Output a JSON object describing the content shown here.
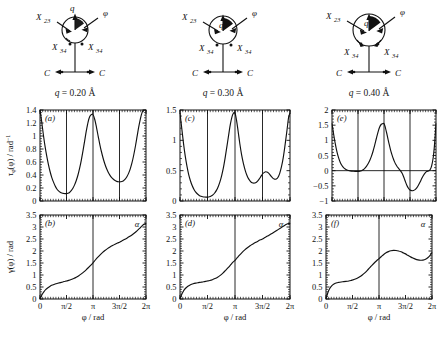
{
  "figure": {
    "columns": [
      {
        "q_label_prefix": "q",
        "q_label_eq": " = 0.20 ",
        "q_label_unit": "Å",
        "schematic": {
          "x23_label": "X",
          "x23_sub": "23",
          "x34_left_label": "X",
          "x34_left_sub": "34",
          "x34_right_label": "X",
          "x34_right_sub": "34",
          "q_arrow_label": "q",
          "phi_label": "φ",
          "c_left_label": "C",
          "c_right_label": "C"
        }
      },
      {
        "q_label_prefix": "q",
        "q_label_eq": " = 0.30 ",
        "q_label_unit": "Å",
        "schematic": {
          "x23_label": "X",
          "x23_sub": "23",
          "x34_left_label": "X",
          "x34_left_sub": "34",
          "x34_right_label": "X",
          "x34_right_sub": "34",
          "q_arrow_label": "q",
          "phi_label": "φ",
          "c_left_label": "C",
          "c_right_label": "C"
        }
      },
      {
        "q_label_prefix": "q",
        "q_label_eq": " = 0.40 ",
        "q_label_unit": "Å",
        "schematic": {
          "x23_label": "X",
          "x23_sub": "23",
          "x34_left_label": "X",
          "x34_left_sub": "34",
          "x34_right_label": "X",
          "x34_right_sub": "34",
          "q_arrow_label": "q",
          "phi_label": "φ",
          "c_left_label": "C",
          "c_right_label": "C"
        }
      }
    ],
    "xaxis": {
      "label_main": "φ",
      "label_unit": " / rad",
      "ticklabels": [
        "0",
        "π/2",
        "π",
        "3π/2",
        "2π"
      ],
      "tickvalues": [
        0,
        1.5707963,
        3.1415927,
        4.712389,
        6.2831853
      ]
    },
    "yaxis_tau": {
      "label_tau": "τ",
      "label_tau_sub": "φ",
      "label_arg": "(φ) / rad",
      "label_exp": "−1"
    },
    "yaxis_gamma": {
      "label": "γ(φ) / rad"
    },
    "alpha_annotation": "α",
    "vertical_guides": [
      1.5707963,
      3.1415927,
      4.712389
    ]
  },
  "chart_data": [
    {
      "id": "a",
      "panel_label": "(a)",
      "type": "line",
      "title": "q = 0.20 Å",
      "xlabel": "φ / rad",
      "ylabel": "τφ(φ) / rad⁻¹",
      "xlim": [
        0,
        6.2831853
      ],
      "ylim": [
        0,
        1.4
      ],
      "yticks": [
        0,
        0.2,
        0.4,
        0.6,
        0.8,
        1,
        1.2,
        1.4
      ],
      "yticklabels": [
        "0",
        "0.2",
        "0.4",
        "0.6",
        "0.8",
        "1",
        "1.2",
        "1.4"
      ],
      "grid": false,
      "vlines": [
        1.5707963,
        3.1415927,
        4.712389
      ],
      "x": [
        0.0,
        0.1,
        0.2,
        0.3,
        0.4,
        0.5,
        0.6,
        0.7,
        0.8,
        0.9,
        1.0,
        1.1,
        1.2,
        1.3,
        1.4,
        1.5,
        1.5708,
        1.65,
        1.75,
        1.85,
        1.95,
        2.05,
        2.15,
        2.25,
        2.35,
        2.45,
        2.55,
        2.65,
        2.75,
        2.85,
        2.95,
        3.05,
        3.1416,
        3.25,
        3.35,
        3.45,
        3.55,
        3.65,
        3.75,
        3.85,
        3.95,
        4.05,
        4.15,
        4.25,
        4.35,
        4.45,
        4.55,
        4.65,
        4.7124,
        4.85,
        4.95,
        5.05,
        5.15,
        5.25,
        5.35,
        5.45,
        5.55,
        5.65,
        5.75,
        5.85,
        5.95,
        6.05,
        6.15,
        6.2832
      ],
      "y": [
        1.4,
        1.22,
        1.02,
        0.84,
        0.69,
        0.56,
        0.45,
        0.36,
        0.29,
        0.23,
        0.185,
        0.155,
        0.135,
        0.122,
        0.116,
        0.113,
        0.113,
        0.118,
        0.132,
        0.158,
        0.196,
        0.248,
        0.315,
        0.4,
        0.505,
        0.63,
        0.775,
        0.93,
        1.085,
        1.215,
        1.3,
        1.33,
        1.33,
        1.25,
        1.13,
        0.995,
        0.865,
        0.75,
        0.65,
        0.565,
        0.495,
        0.44,
        0.395,
        0.36,
        0.335,
        0.315,
        0.302,
        0.296,
        0.295,
        0.3,
        0.312,
        0.335,
        0.372,
        0.425,
        0.495,
        0.585,
        0.7,
        0.835,
        0.985,
        1.135,
        1.265,
        1.36,
        1.4,
        1.4
      ]
    },
    {
      "id": "b",
      "panel_label": "(b)",
      "type": "line",
      "title": "",
      "xlabel": "φ / rad",
      "ylabel": "γ(φ) / rad",
      "xlim": [
        0,
        6.2831853
      ],
      "ylim": [
        0,
        3.5
      ],
      "yticks": [
        0,
        0.5,
        1,
        1.5,
        2,
        2.5,
        3,
        3.5
      ],
      "yticklabels": [
        "0",
        "0.5",
        "1",
        "1.5",
        "2",
        "2.5",
        "3",
        "3.5"
      ],
      "grid": false,
      "vlines": [
        3.1415927
      ],
      "annotation": "α",
      "x": [
        0.0,
        0.08,
        0.16,
        0.25,
        0.35,
        0.45,
        0.6,
        0.75,
        0.9,
        1.05,
        1.2,
        1.35,
        1.5,
        1.5708,
        1.7,
        1.85,
        2.0,
        2.15,
        2.3,
        2.45,
        2.6,
        2.75,
        2.9,
        3.0,
        3.1416,
        3.28,
        3.4,
        3.55,
        3.7,
        3.85,
        4.0,
        4.15,
        4.3,
        4.45,
        4.6,
        4.7124,
        4.85,
        5.0,
        5.15,
        5.3,
        5.45,
        5.6,
        5.75,
        5.9,
        6.05,
        6.18,
        6.2832
      ],
      "y": [
        0.0,
        0.13,
        0.23,
        0.32,
        0.4,
        0.46,
        0.535,
        0.585,
        0.625,
        0.655,
        0.683,
        0.71,
        0.74,
        0.752,
        0.775,
        0.81,
        0.853,
        0.905,
        0.968,
        1.045,
        1.13,
        1.225,
        1.33,
        1.4,
        1.51,
        1.625,
        1.72,
        1.83,
        1.93,
        2.02,
        2.1,
        2.17,
        2.23,
        2.285,
        2.335,
        2.365,
        2.42,
        2.475,
        2.535,
        2.6,
        2.67,
        2.75,
        2.84,
        2.94,
        3.05,
        3.12,
        3.1416
      ]
    },
    {
      "id": "c",
      "panel_label": "(c)",
      "type": "line",
      "title": "q = 0.30 Å",
      "xlabel": "φ / rad",
      "ylabel": "τφ(φ) / rad⁻¹",
      "xlim": [
        0,
        6.2831853
      ],
      "ylim": [
        0,
        1.5
      ],
      "yticks": [
        0,
        0.5,
        1,
        1.5
      ],
      "yticklabels": [
        "0",
        "0.5",
        "1",
        "1.5"
      ],
      "grid": false,
      "vlines": [
        1.5707963,
        3.1415927,
        4.712389
      ],
      "x": [
        0.0,
        0.1,
        0.2,
        0.3,
        0.4,
        0.5,
        0.6,
        0.7,
        0.8,
        0.9,
        1.0,
        1.1,
        1.2,
        1.3,
        1.4,
        1.5,
        1.5708,
        1.68,
        1.78,
        1.88,
        1.98,
        2.08,
        2.18,
        2.28,
        2.38,
        2.48,
        2.58,
        2.68,
        2.78,
        2.88,
        2.98,
        3.06,
        3.1416,
        3.23,
        3.32,
        3.42,
        3.52,
        3.62,
        3.72,
        3.82,
        3.92,
        4.02,
        4.12,
        4.22,
        4.32,
        4.42,
        4.52,
        4.62,
        4.7124,
        4.8,
        4.9,
        5.0,
        5.1,
        5.2,
        5.3,
        5.4,
        5.5,
        5.6,
        5.7,
        5.8,
        5.9,
        6.0,
        6.1,
        6.2,
        6.2832
      ],
      "y": [
        1.45,
        1.2,
        0.95,
        0.74,
        0.57,
        0.43,
        0.33,
        0.25,
        0.19,
        0.145,
        0.115,
        0.092,
        0.078,
        0.07,
        0.066,
        0.065,
        0.065,
        0.07,
        0.082,
        0.102,
        0.132,
        0.175,
        0.235,
        0.315,
        0.42,
        0.55,
        0.715,
        0.9,
        1.09,
        1.27,
        1.4,
        1.45,
        1.45,
        1.33,
        1.15,
        0.94,
        0.76,
        0.62,
        0.51,
        0.425,
        0.365,
        0.325,
        0.302,
        0.295,
        0.302,
        0.325,
        0.36,
        0.405,
        0.445,
        0.468,
        0.482,
        0.473,
        0.448,
        0.41,
        0.378,
        0.36,
        0.362,
        0.392,
        0.46,
        0.57,
        0.72,
        0.92,
        1.14,
        1.37,
        1.45
      ]
    },
    {
      "id": "d",
      "panel_label": "(d)",
      "type": "line",
      "title": "",
      "xlabel": "φ / rad",
      "ylabel": "γ(φ) / rad",
      "xlim": [
        0,
        6.2831853
      ],
      "ylim": [
        0,
        3.5
      ],
      "yticks": [
        0,
        0.5,
        1,
        1.5,
        2,
        2.5,
        3,
        3.5
      ],
      "yticklabels": [
        "0",
        "0.5",
        "1",
        "1.5",
        "2",
        "2.5",
        "3",
        "3.5"
      ],
      "grid": false,
      "vlines": [
        3.1415927
      ],
      "annotation": "α",
      "x": [
        0.0,
        0.08,
        0.16,
        0.25,
        0.35,
        0.45,
        0.6,
        0.75,
        0.9,
        1.05,
        1.2,
        1.35,
        1.5,
        1.5708,
        1.7,
        1.85,
        2.0,
        2.15,
        2.3,
        2.45,
        2.6,
        2.75,
        2.9,
        3.0,
        3.1416,
        3.28,
        3.4,
        3.55,
        3.7,
        3.85,
        4.0,
        4.15,
        4.3,
        4.45,
        4.6,
        4.7124,
        4.85,
        5.0,
        5.15,
        5.3,
        5.45,
        5.6,
        5.75,
        5.9,
        6.05,
        6.18,
        6.2832
      ],
      "y": [
        0.0,
        0.16,
        0.28,
        0.39,
        0.47,
        0.53,
        0.595,
        0.635,
        0.662,
        0.682,
        0.7,
        0.718,
        0.74,
        0.75,
        0.772,
        0.805,
        0.85,
        0.908,
        0.985,
        1.08,
        1.19,
        1.305,
        1.43,
        1.515,
        1.61,
        1.73,
        1.83,
        1.945,
        2.045,
        2.135,
        2.215,
        2.285,
        2.35,
        2.41,
        2.465,
        2.5,
        2.56,
        2.62,
        2.685,
        2.75,
        2.82,
        2.89,
        2.96,
        3.03,
        3.1,
        3.14,
        3.1416
      ]
    },
    {
      "id": "e",
      "panel_label": "(e)",
      "type": "line",
      "title": "q = 0.40 Å",
      "xlabel": "φ / rad",
      "ylabel": "τφ(φ) / rad⁻¹",
      "xlim": [
        0,
        6.2831853
      ],
      "ylim": [
        -1,
        2
      ],
      "yticks": [
        -1,
        -0.5,
        0,
        0.5,
        1,
        1.5,
        2
      ],
      "yticklabels": [
        "−1",
        "−0.5",
        "0",
        "0.5",
        "1",
        "1.5",
        "2"
      ],
      "grid": false,
      "vlines": [
        1.5707963,
        3.1415927,
        4.712389
      ],
      "zeroline": 0,
      "x": [
        0.0,
        0.1,
        0.2,
        0.3,
        0.4,
        0.5,
        0.6,
        0.7,
        0.8,
        0.9,
        1.0,
        1.1,
        1.2,
        1.3,
        1.4,
        1.5,
        1.5708,
        1.68,
        1.78,
        1.88,
        1.98,
        2.08,
        2.18,
        2.28,
        2.38,
        2.48,
        2.58,
        2.68,
        2.78,
        2.88,
        2.98,
        3.06,
        3.1416,
        3.22,
        3.3,
        3.38,
        3.46,
        3.54,
        3.62,
        3.7,
        3.78,
        3.86,
        3.94,
        4.02,
        4.12,
        4.22,
        4.32,
        4.42,
        4.52,
        4.62,
        4.7124,
        4.82,
        4.92,
        5.02,
        5.12,
        5.22,
        5.32,
        5.42,
        5.52,
        5.62,
        5.72,
        5.82,
        5.92,
        6.02,
        6.12,
        6.2,
        6.2832
      ],
      "y": [
        1.55,
        1.2,
        0.88,
        0.62,
        0.42,
        0.27,
        0.17,
        0.1,
        0.055,
        0.025,
        0.005,
        -0.008,
        -0.015,
        -0.02,
        -0.023,
        -0.025,
        -0.025,
        -0.018,
        0.0,
        0.03,
        0.075,
        0.14,
        0.225,
        0.335,
        0.47,
        0.64,
        0.84,
        1.06,
        1.27,
        1.44,
        1.53,
        1.55,
        1.55,
        1.43,
        1.25,
        1.05,
        0.855,
        0.68,
        0.53,
        0.4,
        0.29,
        0.2,
        0.13,
        0.075,
        0.01,
        -0.07,
        -0.19,
        -0.34,
        -0.48,
        -0.58,
        -0.64,
        -0.66,
        -0.655,
        -0.625,
        -0.565,
        -0.48,
        -0.375,
        -0.262,
        -0.16,
        -0.08,
        -0.03,
        -0.01,
        0.025,
        0.16,
        0.45,
        0.9,
        1.55
      ]
    },
    {
      "id": "f",
      "panel_label": "(f)",
      "type": "line",
      "title": "",
      "xlabel": "φ / rad",
      "ylabel": "γ(φ) / rad",
      "xlim": [
        0,
        6.2831853
      ],
      "ylim": [
        0,
        3.5
      ],
      "yticks": [
        0,
        0.5,
        1,
        1.5,
        2,
        2.5,
        3,
        3.5
      ],
      "yticklabels": [
        "0",
        "0.5",
        "1",
        "1.5",
        "2",
        "2.5",
        "3",
        "3.5"
      ],
      "grid": false,
      "vlines": [
        3.1415927
      ],
      "annotation": "α",
      "x": [
        0.0,
        0.08,
        0.16,
        0.25,
        0.35,
        0.45,
        0.6,
        0.75,
        0.9,
        1.05,
        1.2,
        1.35,
        1.5,
        1.5708,
        1.7,
        1.85,
        2.0,
        2.15,
        2.3,
        2.45,
        2.6,
        2.75,
        2.9,
        3.0,
        3.1416,
        3.28,
        3.42,
        3.56,
        3.7,
        3.85,
        4.0,
        4.15,
        4.3,
        4.45,
        4.6,
        4.7124,
        4.85,
        5.0,
        5.15,
        5.3,
        5.45,
        5.6,
        5.75,
        5.9,
        6.05,
        6.18,
        6.2832
      ],
      "y": [
        0.0,
        0.2,
        0.35,
        0.47,
        0.56,
        0.615,
        0.665,
        0.692,
        0.71,
        0.722,
        0.735,
        0.75,
        0.775,
        0.79,
        0.82,
        0.865,
        0.925,
        1.0,
        1.09,
        1.195,
        1.31,
        1.425,
        1.53,
        1.595,
        1.68,
        1.77,
        1.855,
        1.925,
        1.975,
        2.01,
        2.025,
        2.02,
        2.0,
        1.965,
        1.915,
        1.88,
        1.82,
        1.76,
        1.705,
        1.66,
        1.63,
        1.615,
        1.62,
        1.655,
        1.73,
        1.83,
        1.93
      ]
    }
  ]
}
